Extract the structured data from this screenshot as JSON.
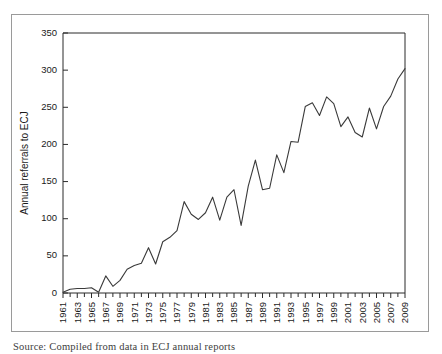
{
  "figure": {
    "source_caption": "Source: Compiled from data in ECJ annual reports"
  },
  "chart_data": {
    "type": "line",
    "title": "",
    "xlabel": "",
    "ylabel": "Annual referrals to ECJ",
    "ylim": [
      0,
      350
    ],
    "ytick_values": [
      0,
      50,
      100,
      150,
      200,
      250,
      300,
      350
    ],
    "ytick_labels": [
      "0",
      "50",
      "100",
      "150",
      "200",
      "250",
      "300",
      "350"
    ],
    "xlim": [
      1961,
      2009
    ],
    "xtick_labels": [
      "1961",
      "1963",
      "1965",
      "1967",
      "1969",
      "1971",
      "1973",
      "1975",
      "1977",
      "1979",
      "1981",
      "1983",
      "1985",
      "1987",
      "1989",
      "1991",
      "1993",
      "1995",
      "1997",
      "1999",
      "2001",
      "2003",
      "2005",
      "2007",
      "2009"
    ],
    "xtick_label_interval_years": 2,
    "minor_tick_interval_years": 1,
    "grid": false,
    "legend": false,
    "series": [
      {
        "name": "Annual referrals to ECJ",
        "color": "#3a3a3a",
        "x": [
          1961,
          1962,
          1963,
          1964,
          1965,
          1966,
          1967,
          1968,
          1969,
          1970,
          1971,
          1972,
          1973,
          1974,
          1975,
          1976,
          1977,
          1978,
          1979,
          1980,
          1981,
          1982,
          1983,
          1984,
          1985,
          1986,
          1987,
          1988,
          1989,
          1990,
          1991,
          1992,
          1993,
          1994,
          1995,
          1996,
          1997,
          1998,
          1999,
          2000,
          2001,
          2002,
          2003,
          2004,
          2005,
          2006,
          2007,
          2008,
          2009
        ],
        "values": [
          1,
          5,
          6,
          6,
          7,
          1,
          23,
          9,
          17,
          32,
          37,
          40,
          61,
          39,
          69,
          75,
          84,
          123,
          106,
          99,
          108,
          129,
          98,
          129,
          139,
          91,
          144,
          179,
          139,
          141,
          186,
          162,
          204,
          203,
          251,
          256,
          239,
          264,
          255,
          224,
          237,
          216,
          210,
          249,
          221,
          251,
          265,
          288,
          302
        ]
      }
    ]
  }
}
